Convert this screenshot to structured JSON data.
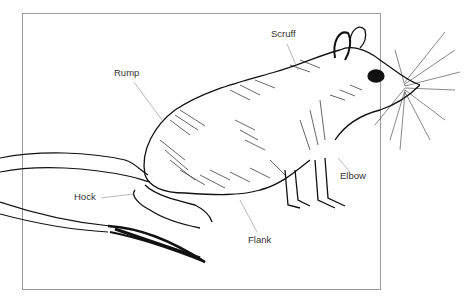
{
  "diagram": {
    "style": "pen-and-ink line illustration",
    "labels": [
      {
        "id": "scruff",
        "text": "Scruff",
        "x": 271,
        "y": 29
      },
      {
        "id": "rump",
        "text": "Rump",
        "x": 114,
        "y": 68
      },
      {
        "id": "hock",
        "text": "Hock",
        "x": 74,
        "y": 192
      },
      {
        "id": "flank",
        "text": "Flank",
        "x": 248,
        "y": 235
      },
      {
        "id": "elbow",
        "text": "Elbow",
        "x": 340,
        "y": 171
      }
    ],
    "colors": {
      "ink": "#111111",
      "leader": "#8a8a8a",
      "frame": "#9a9a9a",
      "background": "#ffffff"
    }
  }
}
